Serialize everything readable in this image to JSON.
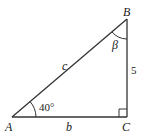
{
  "diagram": {
    "type": "right-triangle",
    "vertices": {
      "A": {
        "label": "A"
      },
      "B": {
        "label": "B"
      },
      "C": {
        "label": "C"
      }
    },
    "sides": {
      "hypotenuse": {
        "label": "c"
      },
      "base": {
        "label": "b"
      },
      "vertical": {
        "label": "5"
      }
    },
    "angles": {
      "A": {
        "label": "40°"
      },
      "B": {
        "label": "β"
      },
      "C": {
        "right_angle": true
      }
    },
    "colors": {
      "stroke": "#333333",
      "text": "#222222"
    }
  }
}
